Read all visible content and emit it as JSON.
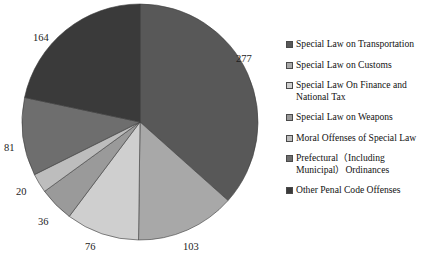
{
  "chart_data": {
    "type": "pie",
    "title": "Offenses",
    "title_visible_fragment": "Offenses",
    "legend_position": "right",
    "grid": false,
    "total": 757,
    "categories": [
      "Special Law on Transportation",
      "Special Law on Customs",
      "Special Law On Finance and National Tax",
      "Special Law on Weapons",
      "Moral Offenses of Special Law",
      "Prefectural（Including Municipal）Ordinances",
      "Other Penal Code Offenses"
    ],
    "values": [
      277,
      103,
      76,
      36,
      20,
      81,
      164
    ],
    "colors": [
      "#585858",
      "#a8a8a8",
      "#cfcfcf",
      "#9a9a9a",
      "#bdbdbd",
      "#6e6e6e",
      "#3a3a3a"
    ],
    "data_labels": [
      "277",
      "103",
      "76",
      "36",
      "20",
      "81",
      "164"
    ],
    "xlabel": "",
    "ylabel": ""
  },
  "legend": {
    "items": [
      {
        "label": "Special Law on Transportation",
        "color": "#585858",
        "value": 277
      },
      {
        "label": "Special Law on Customs",
        "color": "#a8a8a8",
        "value": 103
      },
      {
        "label": "Special Law On Finance and National Tax",
        "color": "#cfcfcf",
        "value": 76
      },
      {
        "label": "Special Law on Weapons",
        "color": "#9a9a9a",
        "value": 36
      },
      {
        "label": "Moral Offenses of Special Law",
        "color": "#bdbdbd",
        "value": 20
      },
      {
        "label": "Prefectural（Including Municipal）Ordinances",
        "color": "#6e6e6e",
        "value": 81
      },
      {
        "label": "Other Penal Code Offenses",
        "color": "#3a3a3a",
        "value": 164
      }
    ]
  },
  "labels": {
    "v277": "277",
    "v103": "103",
    "v76": "76",
    "v36": "36",
    "v20": "20",
    "v81": "81",
    "v164": "164"
  }
}
